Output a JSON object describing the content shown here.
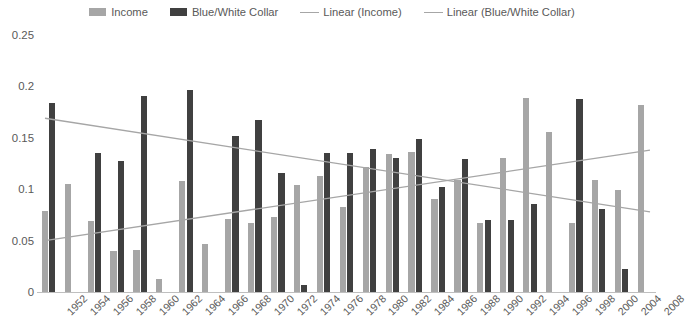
{
  "legend": {
    "position": "top-center",
    "items": [
      {
        "label": "Income",
        "marker": "swatch",
        "color": "#A6A6A6",
        "name": "legend-income"
      },
      {
        "label": "Blue/White Collar",
        "marker": "swatch",
        "color": "#404040",
        "name": "legend-blue-white-collar"
      },
      {
        "label": "Linear (Income)",
        "marker": "line",
        "color": "#A6A6A6",
        "name": "legend-linear-income"
      },
      {
        "label": "Linear (Blue/White Collar)",
        "marker": "line",
        "color": "#A6A6A6",
        "name": "legend-linear-blue-white-collar"
      }
    ]
  },
  "chart_data": {
    "type": "bar",
    "title": "",
    "subtitle": "",
    "xlabel": "",
    "ylabel": "",
    "ylim": [
      0,
      0.25
    ],
    "yticks": [
      0,
      0.05,
      0.1,
      0.15,
      0.2,
      0.25
    ],
    "ytick_labels": [
      "0",
      "0.05",
      "0.1",
      "0.15",
      "0.2",
      "0.25"
    ],
    "grid": false,
    "legend_position": "top-center",
    "categories": [
      "1952",
      "1954",
      "1956",
      "1958",
      "1960",
      "1962",
      "1964",
      "1966",
      "1968",
      "1970",
      "1972",
      "1974",
      "1976",
      "1978",
      "1980",
      "1982",
      "1984",
      "1986",
      "1988",
      "1990",
      "1992",
      "1994",
      "1996",
      "1998",
      "2000",
      "2004",
      "2008"
    ],
    "series": [
      {
        "name": "Income",
        "color": "#A6A6A6",
        "values": [
          0.08,
          0.106,
          0.07,
          0.041,
          0.042,
          0.014,
          0.109,
          0.048,
          0.072,
          0.068,
          0.074,
          0.105,
          0.114,
          0.084,
          0.123,
          0.135,
          0.137,
          0.091,
          0.11,
          0.068,
          0.131,
          0.19,
          0.157,
          0.068,
          0.11,
          0.1,
          0.183
        ]
      },
      {
        "name": "Blue/White Collar",
        "color": "#404040",
        "values": [
          0.185,
          0.0,
          0.136,
          0.128,
          0.192,
          0.0,
          0.197,
          0.0,
          0.153,
          0.168,
          0.117,
          0.008,
          0.136,
          0.136,
          0.14,
          0.131,
          0.15,
          0.103,
          0.13,
          0.071,
          0.071,
          0.087,
          0.0,
          0.189,
          0.082,
          0.023,
          0.0
        ]
      }
    ],
    "trendlines": [
      {
        "name": "Linear (Income)",
        "of_series": "Income",
        "color": "#A6A6A6",
        "y_start": 0.051,
        "y_end": 0.139
      },
      {
        "name": "Linear (Blue/White Collar)",
        "of_series": "Blue/White Collar",
        "color": "#A6A6A6",
        "y_start": 0.17,
        "y_end": 0.079
      }
    ]
  }
}
